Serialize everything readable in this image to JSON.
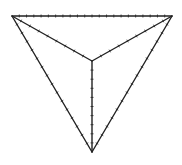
{
  "diagram": {
    "type": "triangular-pyramid-top-view",
    "vertices": {
      "top_left": [
        12,
        16
      ],
      "top_right": [
        172,
        16
      ],
      "bottom": [
        92,
        152
      ],
      "center": [
        92,
        61
      ]
    },
    "edges": [
      {
        "from": "top_left",
        "to": "top_right",
        "ticks": 22
      },
      {
        "from": "top_left",
        "to": "bottom",
        "ticks": 16
      },
      {
        "from": "top_right",
        "to": "bottom",
        "ticks": 16
      },
      {
        "from": "top_left",
        "to": "center",
        "ticks": 9
      },
      {
        "from": "top_right",
        "to": "center",
        "ticks": 9
      },
      {
        "from": "center",
        "to": "bottom",
        "ticks": 10
      }
    ],
    "stroke_color": "#222222",
    "background": "#ffffff"
  }
}
